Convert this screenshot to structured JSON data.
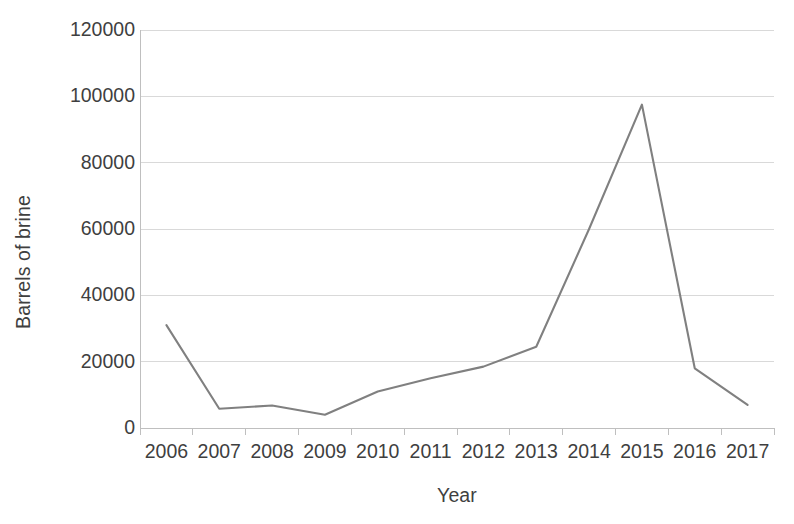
{
  "chart_data": {
    "type": "line",
    "title": "",
    "xlabel": "Year",
    "ylabel": "Barrels of brine",
    "categories": [
      "2006",
      "2007",
      "2008",
      "2009",
      "2010",
      "2011",
      "2012",
      "2013",
      "2014",
      "2015",
      "2016",
      "2017"
    ],
    "series": [
      {
        "name": "Barrels of brine",
        "color": "#808080",
        "values": [
          31000,
          5800,
          6800,
          4000,
          11000,
          15000,
          18500,
          24500,
          60000,
          97500,
          18000,
          7000
        ]
      }
    ],
    "ylim": [
      0,
      120000
    ],
    "y_ticks": [
      0,
      20000,
      40000,
      60000,
      80000,
      100000,
      120000
    ],
    "y_tick_labels": [
      "0",
      "20000",
      "40000",
      "60000",
      "80000",
      "100000",
      "120000"
    ],
    "grid": "horizontal",
    "legend": "none",
    "markers": "none"
  }
}
